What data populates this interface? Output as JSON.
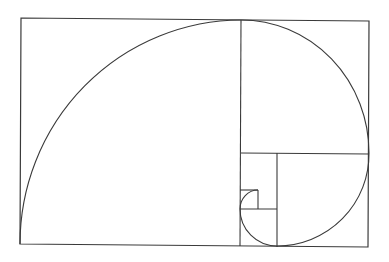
{
  "diagram": {
    "stroke_color": "#3a3a3a",
    "background": "#ffffff",
    "outer_rect": {
      "x1": 21,
      "y1": 18,
      "x2": 369,
      "y2": 246
    },
    "divisions": [
      {
        "name": "vertical-main",
        "x1": 241,
        "y1": 20,
        "x2": 240,
        "y2": 246
      },
      {
        "name": "horizontal-right",
        "x1": 241,
        "y1": 153,
        "x2": 369,
        "y2": 154
      },
      {
        "name": "vertical-lower",
        "x1": 277,
        "y1": 153,
        "x2": 277,
        "y2": 247
      },
      {
        "name": "horizontal-lower",
        "x1": 240,
        "y1": 209,
        "x2": 277,
        "y2": 209
      },
      {
        "name": "small-square-top",
        "x1": 240,
        "y1": 190,
        "x2": 258,
        "y2": 190
      },
      {
        "name": "small-square-right",
        "x1": 258,
        "y1": 190,
        "x2": 258,
        "y2": 209
      }
    ],
    "spiral_path": "M 20 244 A 222 224 0 0 1 241 20 A 128 133 0 0 1 369 153 A 92 92 0 0 1 277 246 A 37 37 0 0 1 240 209 A 18 19 0 0 1 258 190"
  }
}
